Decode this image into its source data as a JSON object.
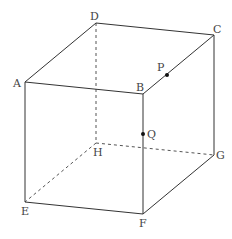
{
  "figure": {
    "type": "cube",
    "labels": {
      "A": "A",
      "B": "B",
      "C": "C",
      "D": "D",
      "E": "E",
      "F": "F",
      "G": "G",
      "H": "H",
      "P": "P",
      "Q": "Q"
    },
    "vertices": {
      "A": [
        25,
        82
      ],
      "B": [
        143,
        94
      ],
      "C": [
        214,
        35
      ],
      "D": [
        96,
        23
      ],
      "E": [
        25,
        202
      ],
      "F": [
        143,
        214
      ],
      "G": [
        214,
        155
      ],
      "H": [
        96,
        143
      ]
    },
    "points": {
      "P": {
        "on_edge": "BC",
        "pos": [
          167,
          75
        ]
      },
      "Q": {
        "on_edge": "BF",
        "pos": [
          143,
          134
        ]
      }
    },
    "visible_edges": [
      "AB",
      "BC",
      "CD",
      "DA",
      "AE",
      "BF",
      "CG",
      "EF",
      "FG"
    ],
    "hidden_edges": [
      "DH",
      "EH",
      "HG"
    ]
  }
}
